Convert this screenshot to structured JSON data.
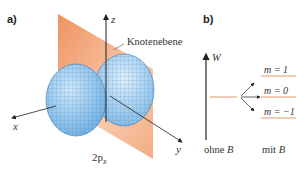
{
  "panel_a": {
    "label": "a)",
    "axis_z": "z",
    "axis_x": "x",
    "axis_y": "y",
    "plane_label": "Knotenebene",
    "orbital_label": "2p",
    "orbital_subscript": "x",
    "colors": {
      "plane": "#f0a070",
      "lobe": "#8cc4ec",
      "grid": "#3a78b8"
    }
  },
  "panel_b": {
    "label": "b)",
    "axis_label": "W",
    "levels": [
      {
        "label": "m = 1"
      },
      {
        "label": "m = 0"
      },
      {
        "label": "m = −1"
      }
    ],
    "left_caption_text": "ohne ",
    "left_caption_var": "B",
    "right_caption_text": "mit ",
    "right_caption_var": "B",
    "colors": {
      "level_line": "#e8956a",
      "arrow": "#222222"
    }
  }
}
